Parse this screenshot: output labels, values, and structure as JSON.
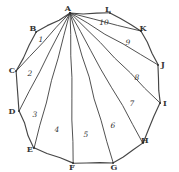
{
  "figure": {
    "type": "geometry-sketch",
    "shape": "dodecagon",
    "vertex_count": 12,
    "region_count": 10,
    "stroke_color": "#2b2b2b",
    "background_color": "#ffffff",
    "canvas": {
      "width": 179,
      "height": 172
    },
    "fan_apex": "A",
    "vertices": [
      {
        "label": "A",
        "x": 70,
        "y": 13,
        "label_x": 68,
        "label_y": 8
      },
      {
        "label": "B",
        "x": 36,
        "y": 32,
        "label_x": 33,
        "label_y": 28
      },
      {
        "label": "C",
        "x": 16,
        "y": 71,
        "label_x": 12,
        "label_y": 70
      },
      {
        "label": "D",
        "x": 19,
        "y": 111,
        "label_x": 12,
        "label_y": 111
      },
      {
        "label": "E",
        "x": 34,
        "y": 148,
        "label_x": 30,
        "label_y": 149
      },
      {
        "label": "F",
        "x": 73,
        "y": 163,
        "label_x": 72,
        "label_y": 167
      },
      {
        "label": "G",
        "x": 113,
        "y": 163,
        "label_x": 114,
        "label_y": 167
      },
      {
        "label": "H",
        "x": 143,
        "y": 143,
        "label_x": 145,
        "label_y": 140
      },
      {
        "label": "I",
        "x": 160,
        "y": 103,
        "label_x": 165,
        "label_y": 103
      },
      {
        "label": "J",
        "x": 158,
        "y": 65,
        "label_x": 163,
        "label_y": 64
      },
      {
        "label": "K",
        "x": 141,
        "y": 31,
        "label_x": 143,
        "label_y": 28
      },
      {
        "label": "L",
        "x": 110,
        "y": 13,
        "label_x": 108,
        "label_y": 9
      }
    ],
    "polygon_edges": [
      {
        "from": "A",
        "to": "B"
      },
      {
        "from": "B",
        "to": "C"
      },
      {
        "from": "C",
        "to": "D"
      },
      {
        "from": "D",
        "to": "E"
      },
      {
        "from": "E",
        "to": "F"
      },
      {
        "from": "F",
        "to": "G"
      },
      {
        "from": "G",
        "to": "H"
      },
      {
        "from": "H",
        "to": "I"
      },
      {
        "from": "I",
        "to": "J"
      },
      {
        "from": "J",
        "to": "K"
      },
      {
        "from": "K",
        "to": "L"
      },
      {
        "from": "L",
        "to": "A"
      }
    ],
    "diagonals": [
      {
        "from": "A",
        "to": "C"
      },
      {
        "from": "A",
        "to": "D"
      },
      {
        "from": "A",
        "to": "E"
      },
      {
        "from": "A",
        "to": "F"
      },
      {
        "from": "A",
        "to": "G"
      },
      {
        "from": "A",
        "to": "H"
      },
      {
        "from": "A",
        "to": "I"
      },
      {
        "from": "A",
        "to": "J"
      },
      {
        "from": "A",
        "to": "K"
      }
    ],
    "regions": [
      {
        "label": "1",
        "triangle": "ABC",
        "x": 41,
        "y": 40
      },
      {
        "label": "2",
        "triangle": "ACD",
        "x": 30,
        "y": 74
      },
      {
        "label": "3",
        "triangle": "ADE",
        "x": 35,
        "y": 115
      },
      {
        "label": "4",
        "triangle": "AEF",
        "x": 57,
        "y": 130
      },
      {
        "label": "5",
        "triangle": "AFG",
        "x": 86,
        "y": 135
      },
      {
        "label": "6",
        "triangle": "AGH",
        "x": 113,
        "y": 126
      },
      {
        "label": "7",
        "triangle": "AHI",
        "x": 132,
        "y": 104
      },
      {
        "label": "8",
        "triangle": "AIJ",
        "x": 137,
        "y": 78
      },
      {
        "label": "9",
        "triangle": "AJK",
        "x": 128,
        "y": 43
      },
      {
        "label": "10",
        "triangle": "AKL",
        "x": 104,
        "y": 23
      }
    ]
  }
}
